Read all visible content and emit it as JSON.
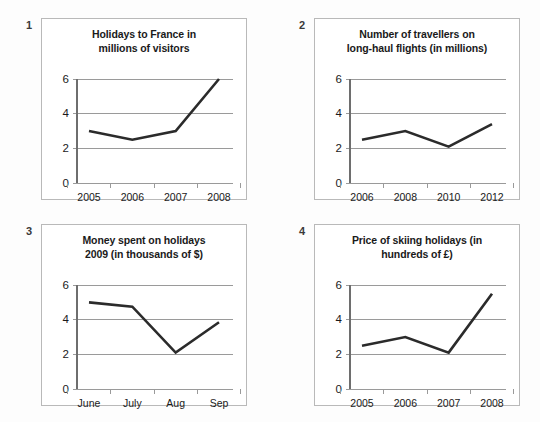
{
  "page": {
    "background_color": "#fdfdfd",
    "panel_border_color": "#b9b9b9",
    "line_color": "#2b2b2b",
    "gridline_color": "#9a9a9a"
  },
  "panels": [
    {
      "index_label": "1",
      "title_line1": "Holidays to France in",
      "title_line2": "millions of visitors"
    },
    {
      "index_label": "2",
      "title_line1": "Number of travellers on",
      "title_line2": "long-haul flights (in millions)"
    },
    {
      "index_label": "3",
      "title_line1": "Money spent on holidays",
      "title_line2": "2009 (in thousands of $)"
    },
    {
      "index_label": "4",
      "title_line1": "Price of skiing holidays (in",
      "title_line2": "hundreds of £)"
    }
  ],
  "chart_data": [
    {
      "type": "line",
      "title": "Holidays to France in millions of visitors",
      "xlabel": "",
      "ylabel": "",
      "categories": [
        "2005",
        "2006",
        "2007",
        "2008"
      ],
      "values": [
        3.0,
        2.5,
        3.0,
        6.0
      ],
      "yticks": [
        0,
        2,
        4,
        6
      ],
      "ylim": [
        0,
        6
      ],
      "grid": true,
      "legend": false
    },
    {
      "type": "line",
      "title": "Number of travellers on long-haul flights (in millions)",
      "xlabel": "",
      "ylabel": "",
      "categories": [
        "2006",
        "2008",
        "2010",
        "2012"
      ],
      "values": [
        2.5,
        3.0,
        2.1,
        3.4
      ],
      "yticks": [
        0,
        2,
        4,
        6
      ],
      "ylim": [
        0,
        6
      ],
      "grid": true,
      "legend": false
    },
    {
      "type": "line",
      "title": "Money spent on holidays 2009 (in thousands of $)",
      "xlabel": "",
      "ylabel": "",
      "categories": [
        "June",
        "July",
        "Aug",
        "Sep"
      ],
      "values": [
        5.0,
        4.75,
        2.1,
        3.85
      ],
      "yticks": [
        0,
        2,
        4,
        6
      ],
      "ylim": [
        0,
        6
      ],
      "grid": true,
      "legend": false
    },
    {
      "type": "line",
      "title": "Price of skiing holidays (in hundreds of £)",
      "xlabel": "",
      "ylabel": "",
      "categories": [
        "2005",
        "2006",
        "2007",
        "2008"
      ],
      "values": [
        2.5,
        3.0,
        2.1,
        5.5
      ],
      "yticks": [
        0,
        2,
        4,
        6
      ],
      "ylim": [
        0,
        6
      ],
      "grid": true,
      "legend": false
    }
  ]
}
